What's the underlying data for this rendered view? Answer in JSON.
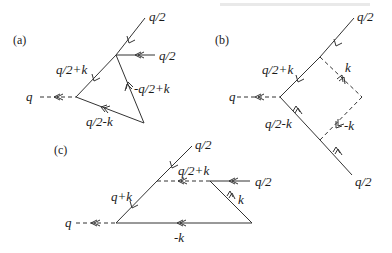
{
  "figure": {
    "type": "feynman-diagrams",
    "panels": [
      {
        "id": "a",
        "label": "(a)",
        "external_out": "q",
        "lines": [
          {
            "label": "q/2",
            "role": "incoming-top",
            "style": "solid"
          },
          {
            "label": "q/2",
            "role": "incoming-horizontal",
            "style": "solid"
          },
          {
            "label": "q/2+k",
            "role": "upper-internal",
            "style": "solid"
          },
          {
            "label": "-q/2+k",
            "role": "right-internal",
            "style": "solid"
          },
          {
            "label": "q/2-k",
            "role": "lower-internal",
            "style": "solid"
          }
        ]
      },
      {
        "id": "b",
        "label": "(b)",
        "external_out": "q",
        "lines": [
          {
            "label": "q/2",
            "role": "incoming-top",
            "style": "solid"
          },
          {
            "label": "q/2+k",
            "role": "upper-internal",
            "style": "solid"
          },
          {
            "label": "k",
            "role": "upper-right-exchange",
            "style": "dashed"
          },
          {
            "label": "-k",
            "role": "lower-right-exchange",
            "style": "dashed"
          },
          {
            "label": "q/2-k",
            "role": "lower-internal",
            "style": "solid"
          },
          {
            "label": "q/2",
            "role": "incoming-bottom",
            "style": "solid"
          }
        ]
      },
      {
        "id": "c",
        "label": "(c)",
        "external_out": "q",
        "lines": [
          {
            "label": "q/2",
            "role": "incoming-top",
            "style": "solid"
          },
          {
            "label": "q/2+k",
            "role": "upper-horizontal",
            "style": "dashed"
          },
          {
            "label": "q/2",
            "role": "incoming-horizontal",
            "style": "solid"
          },
          {
            "label": "q+k",
            "role": "left-internal",
            "style": "solid"
          },
          {
            "label": "k",
            "role": "right-internal",
            "style": "solid"
          },
          {
            "label": "-k",
            "role": "bottom-internal",
            "style": "solid"
          }
        ]
      }
    ]
  }
}
